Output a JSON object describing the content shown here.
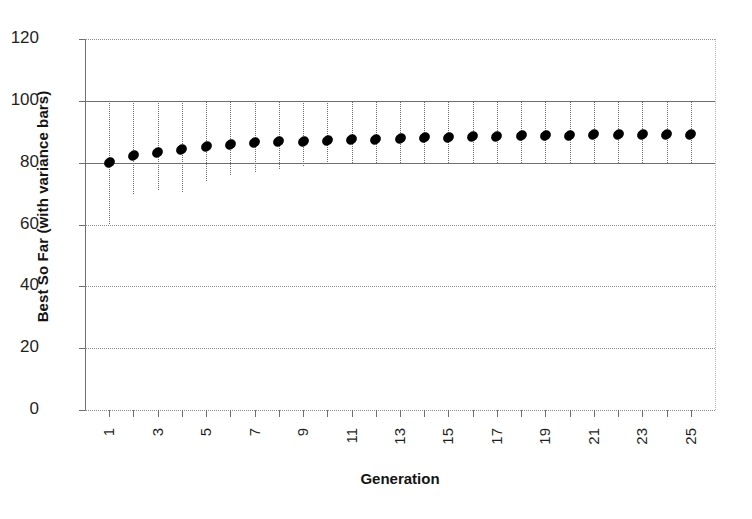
{
  "chart_data": {
    "type": "scatter",
    "title": "",
    "xlabel": "Generation",
    "ylabel": "Best So Far (with variance bars)",
    "xlim": [
      0,
      26
    ],
    "ylim": [
      0,
      120
    ],
    "ytick_values": [
      0,
      20,
      40,
      60,
      80,
      100,
      120
    ],
    "ytick_labels": [
      "0",
      "20",
      "40",
      "60",
      "80",
      "100",
      "120"
    ],
    "xtick_values": [
      1,
      2,
      3,
      4,
      5,
      6,
      7,
      8,
      9,
      10,
      11,
      12,
      13,
      14,
      15,
      16,
      17,
      18,
      19,
      20,
      21,
      22,
      23,
      24,
      25
    ],
    "xtick_labels": [
      "1",
      "",
      "3",
      "",
      "5",
      "",
      "7",
      "",
      "9",
      "",
      "11",
      "",
      "13",
      "",
      "15",
      "",
      "17",
      "",
      "19",
      "",
      "21",
      "",
      "23",
      "",
      "25"
    ],
    "xtick_rotation": 90,
    "grid": true,
    "legend": "none",
    "marker": "filled-diamond",
    "marker_color": "#000000",
    "errorbar_color": "#6a6a6a",
    "errorbar_style": "dotted",
    "x": [
      1,
      2,
      3,
      4,
      5,
      6,
      7,
      8,
      9,
      10,
      11,
      12,
      13,
      14,
      15,
      16,
      17,
      18,
      19,
      20,
      21,
      22,
      23,
      24,
      25
    ],
    "values": [
      80.0,
      82.3,
      83.2,
      84.2,
      85.2,
      85.8,
      86.4,
      86.7,
      86.9,
      87.2,
      87.4,
      87.6,
      87.9,
      88.1,
      88.3,
      88.4,
      88.6,
      88.7,
      88.8,
      88.9,
      89.0,
      89.1,
      89.1,
      89.2,
      89.2
    ],
    "err_upper": [
      100.0,
      100.0,
      100.0,
      100.0,
      100.0,
      100.0,
      100.0,
      100.0,
      100.0,
      100.0,
      100.0,
      100.0,
      100.0,
      100.0,
      100.0,
      100.0,
      100.0,
      100.0,
      100.0,
      100.0,
      100.0,
      100.0,
      100.0,
      100.0,
      100.0
    ],
    "err_lower": [
      60.0,
      70.0,
      71.0,
      70.5,
      74.0,
      76.0,
      77.0,
      78.0,
      79.0,
      79.5,
      80.0,
      80.0,
      80.0,
      80.0,
      80.0,
      80.0,
      80.0,
      80.0,
      80.0,
      80.0,
      80.0,
      80.0,
      80.0,
      80.0,
      80.0
    ]
  }
}
